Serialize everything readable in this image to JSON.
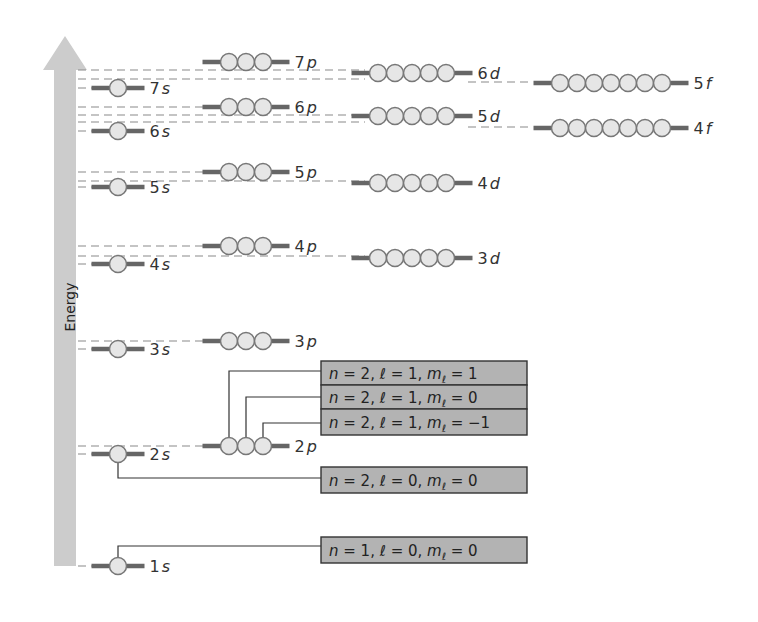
{
  "axis": {
    "label": "Energy",
    "arrow_color": "#cccccc",
    "x": 54,
    "width": 22,
    "top": 36,
    "bottom": 566
  },
  "colors": {
    "orbital_fill": "#e6e6e6",
    "orbital_stroke": "#777777",
    "bar": "#666666",
    "dash": "#8a8a8a",
    "box_fill": "#b3b3b3",
    "box_stroke": "#333333",
    "connector": "#333333",
    "text": "#333333"
  },
  "orbitals": [
    {
      "id": "1s",
      "n": "1",
      "l": "s",
      "count": 1,
      "x": 118,
      "y": 566
    },
    {
      "id": "2s",
      "n": "2",
      "l": "s",
      "count": 1,
      "x": 118,
      "y": 454
    },
    {
      "id": "2p",
      "n": "2",
      "l": "p",
      "count": 3,
      "x": 246,
      "y": 446
    },
    {
      "id": "3s",
      "n": "3",
      "l": "s",
      "count": 1,
      "x": 118,
      "y": 349
    },
    {
      "id": "3p",
      "n": "3",
      "l": "p",
      "count": 3,
      "x": 246,
      "y": 341
    },
    {
      "id": "4s",
      "n": "4",
      "l": "s",
      "count": 1,
      "x": 118,
      "y": 264
    },
    {
      "id": "4p",
      "n": "4",
      "l": "p",
      "count": 3,
      "x": 246,
      "y": 246
    },
    {
      "id": "3d",
      "n": "3",
      "l": "d",
      "count": 5,
      "x": 412,
      "y": 258
    },
    {
      "id": "5s",
      "n": "5",
      "l": "s",
      "count": 1,
      "x": 118,
      "y": 187
    },
    {
      "id": "5p",
      "n": "5",
      "l": "p",
      "count": 3,
      "x": 246,
      "y": 172
    },
    {
      "id": "4d",
      "n": "4",
      "l": "d",
      "count": 5,
      "x": 412,
      "y": 183
    },
    {
      "id": "6s",
      "n": "6",
      "l": "s",
      "count": 1,
      "x": 118,
      "y": 131
    },
    {
      "id": "6p",
      "n": "6",
      "l": "p",
      "count": 3,
      "x": 246,
      "y": 107
    },
    {
      "id": "5d",
      "n": "5",
      "l": "d",
      "count": 5,
      "x": 412,
      "y": 116
    },
    {
      "id": "4f",
      "n": "4",
      "l": "f",
      "count": 7,
      "x": 611,
      "y": 128
    },
    {
      "id": "7s",
      "n": "7",
      "l": "s",
      "count": 1,
      "x": 118,
      "y": 88
    },
    {
      "id": "7p",
      "n": "7",
      "l": "p",
      "count": 3,
      "x": 246,
      "y": 62
    },
    {
      "id": "6d",
      "n": "6",
      "l": "d",
      "count": 5,
      "x": 412,
      "y": 73
    },
    {
      "id": "5f",
      "n": "5",
      "l": "f",
      "count": 7,
      "x": 611,
      "y": 83
    }
  ],
  "dash_lines": [
    {
      "y": 454,
      "x1": 78,
      "x2": 100
    },
    {
      "y": 446,
      "x1": 78,
      "x2": 228
    },
    {
      "y": 566,
      "x1": 78,
      "x2": 100
    },
    {
      "y": 349,
      "x1": 78,
      "x2": 100
    },
    {
      "y": 341,
      "x1": 78,
      "x2": 228
    },
    {
      "y": 264,
      "x1": 78,
      "x2": 100
    },
    {
      "y": 246,
      "x1": 78,
      "x2": 228
    },
    {
      "y": 256,
      "x1": 78,
      "x2": 365
    },
    {
      "y": 187,
      "x1": 78,
      "x2": 100
    },
    {
      "y": 172,
      "x1": 78,
      "x2": 228
    },
    {
      "y": 181,
      "x1": 78,
      "x2": 365
    },
    {
      "y": 131,
      "x1": 78,
      "x2": 100
    },
    {
      "y": 107,
      "x1": 78,
      "x2": 228
    },
    {
      "y": 115,
      "x1": 78,
      "x2": 365
    },
    {
      "y": 122,
      "x1": 78,
      "x2": 365
    },
    {
      "y": 127,
      "x1": 468,
      "x2": 530
    },
    {
      "y": 88,
      "x1": 78,
      "x2": 100
    },
    {
      "y": 70,
      "x1": 78,
      "x2": 365
    },
    {
      "y": 79,
      "x1": 78,
      "x2": 365
    },
    {
      "y": 82,
      "x1": 468,
      "x2": 530
    }
  ],
  "quantum_boxes": [
    {
      "text_n": "n = 2, ",
      "text_l": "ℓ = 1, ",
      "text_m": "m",
      "sub": "ℓ",
      "value": " = 1",
      "x": 321,
      "y": 361,
      "w": 206,
      "h": 24,
      "target": "2p-0",
      "link_y": 371
    },
    {
      "text_n": "n = 2, ",
      "text_l": "ℓ = 1, ",
      "text_m": "m",
      "sub": "ℓ",
      "value": " = 0",
      "x": 321,
      "y": 385,
      "w": 206,
      "h": 24,
      "target": "2p-1",
      "link_y": 397
    },
    {
      "text_n": "n = 2, ",
      "text_l": "ℓ = 1, ",
      "text_m": "m",
      "sub": "ℓ",
      "value": " = −1",
      "x": 321,
      "y": 409,
      "w": 206,
      "h": 26,
      "target": "2p-2",
      "link_y": 423
    },
    {
      "text_n": "n = 2, ",
      "text_l": "ℓ = 0, ",
      "text_m": "m",
      "sub": "ℓ",
      "value": " = 0",
      "x": 321,
      "y": 467,
      "w": 206,
      "h": 26,
      "target": "2s-0",
      "link_y": 478
    },
    {
      "text_n": "n = 1, ",
      "text_l": "ℓ = 0, ",
      "text_m": "m",
      "sub": "ℓ",
      "value": " = 0",
      "x": 321,
      "y": 537,
      "w": 206,
      "h": 26,
      "target": "1s-0",
      "link_y": 546
    }
  ]
}
